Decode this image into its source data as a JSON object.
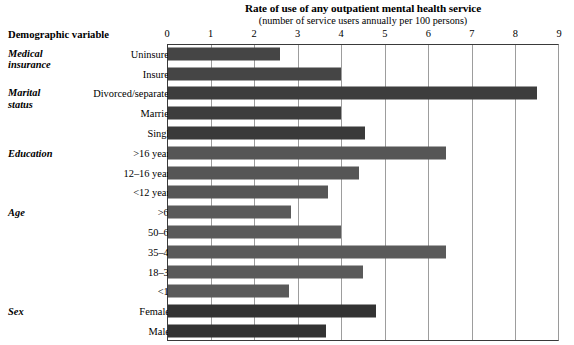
{
  "chart_data": {
    "type": "bar",
    "orientation": "horizontal",
    "title": "Rate of use of any outpatient mental health service",
    "subtitle": "(number of service users annually per 100 persons)",
    "xlabel": "",
    "ylabel": "Demographic variable",
    "xlim": [
      0,
      9
    ],
    "xticks": [
      0,
      1,
      2,
      3,
      4,
      5,
      6,
      7,
      8,
      9
    ],
    "xtick_labels": [
      "0",
      "1",
      "2",
      "3",
      "4",
      "5",
      "6",
      "7",
      "8",
      "9"
    ],
    "grid": true,
    "legend": "none",
    "categories": [
      "Uninsured",
      "Insured",
      "Divorced/separated",
      "Married",
      "Single",
      ">16 years",
      "12–16 years",
      "<12 years",
      ">65",
      "50–65",
      "35–49",
      "18–34",
      "<18",
      "Females",
      "Males"
    ],
    "values": [
      2.6,
      4.0,
      8.5,
      4.0,
      4.55,
      6.4,
      4.4,
      3.7,
      2.85,
      4.0,
      6.4,
      4.5,
      2.8,
      4.8,
      3.65
    ],
    "groups": [
      {
        "label": "Medical insurance",
        "label_lines": [
          "Medical",
          "insurance"
        ],
        "start": 0,
        "count": 2,
        "color": "#454545"
      },
      {
        "label": "Marital status",
        "label_lines": [
          "Marital",
          "status"
        ],
        "start": 2,
        "count": 3,
        "color": "#3d3d3d"
      },
      {
        "label": "Education",
        "label_lines": [
          "Education"
        ],
        "start": 5,
        "count": 3,
        "color": "#565656"
      },
      {
        "label": "Age",
        "label_lines": [
          "Age"
        ],
        "start": 8,
        "count": 5,
        "color": "#5a5a5a"
      },
      {
        "label": "Sex",
        "label_lines": [
          "Sex"
        ],
        "start": 13,
        "count": 2,
        "color": "#333333"
      }
    ],
    "bar_colors": [
      "#454545",
      "#454545",
      "#3d3d3d",
      "#3d3d3d",
      "#3a3a3a",
      "#565656",
      "#565656",
      "#565656",
      "#5a5a5a",
      "#5a5a5a",
      "#5a5a5a",
      "#5a5a5a",
      "#5a5a5a",
      "#333333",
      "#333333"
    ]
  },
  "colors": {
    "gridline": "#9d9d9d",
    "axis": "#3a3a3a",
    "background": "#ffffff",
    "text": "#000000"
  }
}
